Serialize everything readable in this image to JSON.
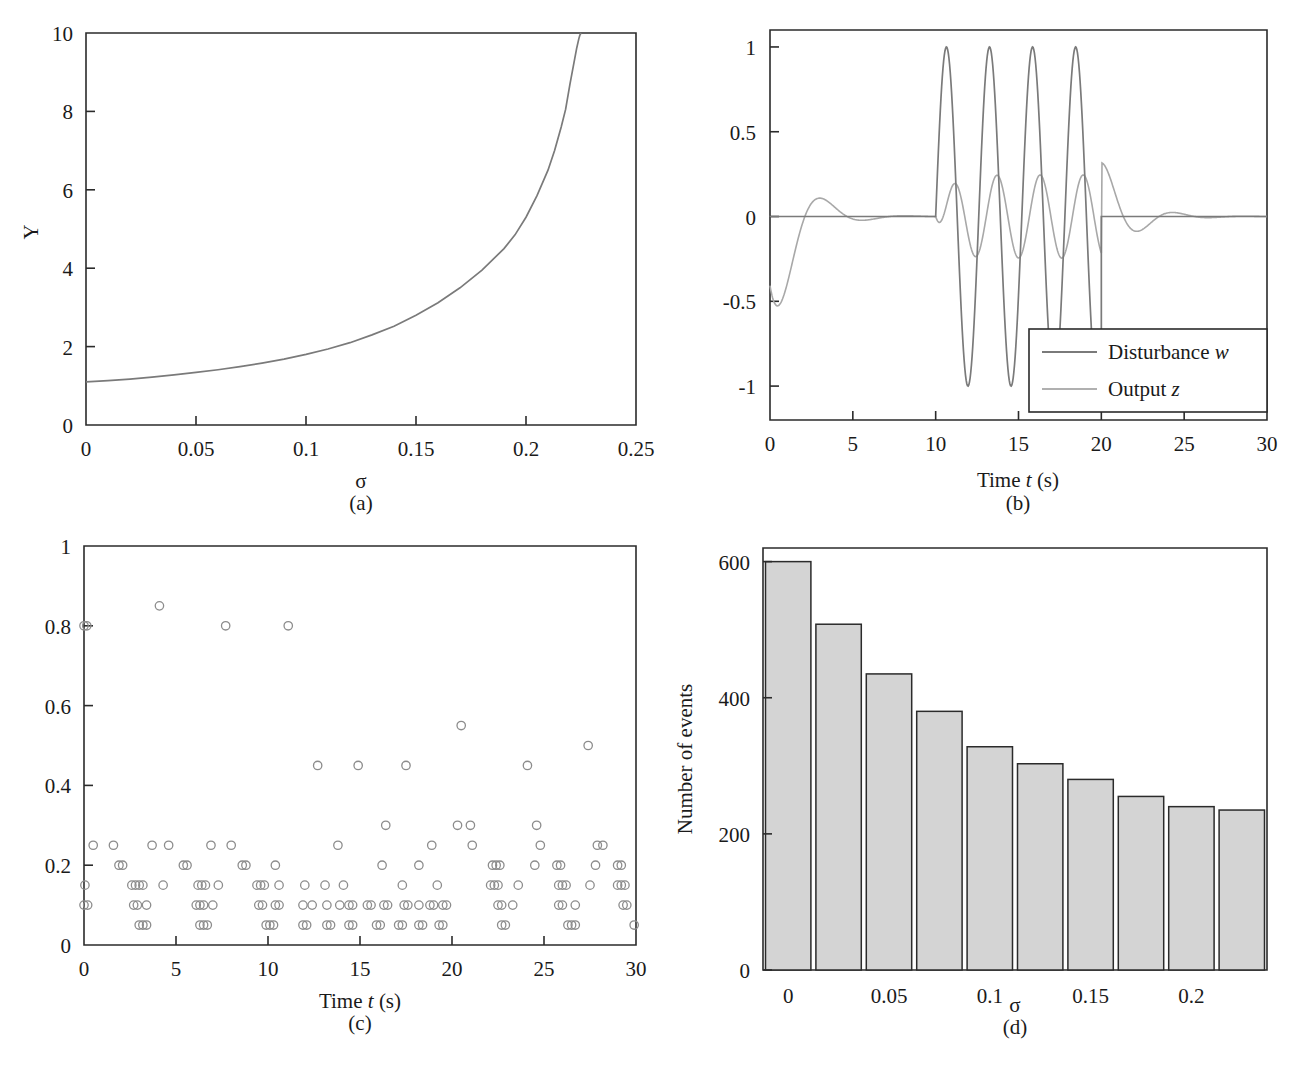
{
  "figure": {
    "running_head_fragment": "",
    "panels": [
      {
        "id": "a",
        "caption": "(a)",
        "chart_data": {
          "type": "line",
          "title": "",
          "xlabel": "σ",
          "ylabel": "Y",
          "xlim": [
            0,
            0.25
          ],
          "ylim": [
            0,
            10
          ],
          "xticks": [
            0,
            0.05,
            0.1,
            0.15,
            0.2,
            0.25
          ],
          "xticklabels": [
            "0",
            "0.05",
            "0.1",
            "0.15",
            "0.2",
            "0.25"
          ],
          "yticks": [
            0,
            2,
            4,
            6,
            8,
            10
          ],
          "yticklabels": [
            "0",
            "2",
            "4",
            "6",
            "8",
            "10"
          ],
          "grid": false,
          "legend": "none",
          "series": [
            {
              "name": "Y(σ)",
              "color": "#7a7a7a",
              "x": [
                0,
                0.01,
                0.02,
                0.03,
                0.04,
                0.05,
                0.06,
                0.07,
                0.08,
                0.09,
                0.1,
                0.11,
                0.12,
                0.13,
                0.14,
                0.15,
                0.16,
                0.17,
                0.18,
                0.19,
                0.195,
                0.2,
                0.205,
                0.21,
                0.213,
                0.216,
                0.218,
                0.22,
                0.221,
                0.222,
                0.223,
                0.224,
                0.2245,
                0.225
              ],
              "y": [
                1.1,
                1.13,
                1.17,
                1.22,
                1.28,
                1.34,
                1.41,
                1.49,
                1.58,
                1.68,
                1.8,
                1.94,
                2.1,
                2.3,
                2.52,
                2.8,
                3.12,
                3.5,
                3.95,
                4.5,
                4.85,
                5.3,
                5.85,
                6.5,
                7.0,
                7.6,
                8.05,
                8.7,
                9.0,
                9.3,
                9.6,
                9.85,
                9.95,
                10.0
              ]
            }
          ]
        }
      },
      {
        "id": "b",
        "caption": "(b)",
        "chart_data": {
          "type": "line",
          "title": "",
          "xlabel": "Time t (s)",
          "xlabel_parts": {
            "pre": "Time ",
            "ital": "t",
            "post": " (s)"
          },
          "ylabel": "",
          "xlim": [
            0,
            30
          ],
          "ylim": [
            -1.2,
            1.1
          ],
          "xticks": [
            0,
            5,
            10,
            15,
            20,
            25,
            30
          ],
          "xticklabels": [
            "0",
            "5",
            "10",
            "15",
            "20",
            "25",
            "30"
          ],
          "yticks": [
            -1,
            -0.5,
            0,
            0.5,
            1
          ],
          "yticklabels": [
            "-1",
            "-0.5",
            "0",
            "0.5",
            "1"
          ],
          "grid": false,
          "legend": "inside-bottom-right",
          "legend_entries": [
            {
              "label": "Disturbance w",
              "label_pre": "Disturbance ",
              "label_ital": "w",
              "color": "#7a7a7a"
            },
            {
              "label": "Output z",
              "label_pre": "Output ",
              "label_ital": "z",
              "color": "#b0b0b0"
            }
          ],
          "series": [
            {
              "name": "Disturbance w",
              "color": "#7a7a7a",
              "description": "Zero for t<10; sinusoid amplitude 1, period ~2.6 s, for 10<=t<=20; zero for t>20",
              "burst_start": 10,
              "burst_end": 20,
              "amplitude": 1,
              "period": 2.6
            },
            {
              "name": "Output z",
              "color": "#b0b0b0",
              "description": "Initial transient dipping to -0.62 near t=1, recovers by t=4 with small bump +0.05 at t=4.6; during burst oscillates between -0.22 and +0.25; after t=20 overshoot +0.3 at t=20.8 decaying to 0 by t=24",
              "initial_min": -0.62,
              "initial_min_time": 1.1,
              "bump_peak": 0.05,
              "bump_time": 4.6,
              "burst_max": 0.25,
              "burst_min": -0.22,
              "post_overshoot": 0.3,
              "post_overshoot_time": 20.8
            }
          ]
        }
      },
      {
        "id": "c",
        "caption": "(c)",
        "chart_data": {
          "type": "scatter",
          "title": "",
          "xlabel": "Time t (s)",
          "xlabel_parts": {
            "pre": "Time ",
            "ital": "t",
            "post": " (s)"
          },
          "ylabel": "",
          "xlim": [
            0,
            30
          ],
          "ylim": [
            0,
            1
          ],
          "xticks": [
            0,
            5,
            10,
            15,
            20,
            25,
            30
          ],
          "xticklabels": [
            "0",
            "5",
            "10",
            "15",
            "20",
            "25",
            "30"
          ],
          "yticks": [
            0,
            0.2,
            0.4,
            0.6,
            0.8,
            1
          ],
          "yticklabels": [
            "0",
            "0.2",
            "0.4",
            "0.6",
            "0.8",
            "1"
          ],
          "grid": false,
          "legend": "none",
          "marker": "open-circle",
          "marker_color": "#8c8c8c",
          "points": [
            [
              0.0,
              0.8
            ],
            [
              0.15,
              0.8
            ],
            [
              4.1,
              0.85
            ],
            [
              7.7,
              0.8
            ],
            [
              11.1,
              0.8
            ],
            [
              20.5,
              0.55
            ],
            [
              27.4,
              0.5
            ],
            [
              12.7,
              0.45
            ],
            [
              14.9,
              0.45
            ],
            [
              17.5,
              0.45
            ],
            [
              24.1,
              0.45
            ],
            [
              16.4,
              0.3
            ],
            [
              20.3,
              0.3
            ],
            [
              21.0,
              0.3
            ],
            [
              24.6,
              0.3
            ],
            [
              0.5,
              0.25
            ],
            [
              1.6,
              0.25
            ],
            [
              3.7,
              0.25
            ],
            [
              4.6,
              0.25
            ],
            [
              6.9,
              0.25
            ],
            [
              8.0,
              0.25
            ],
            [
              13.8,
              0.25
            ],
            [
              18.9,
              0.25
            ],
            [
              21.1,
              0.25
            ],
            [
              24.8,
              0.25
            ],
            [
              27.9,
              0.25
            ],
            [
              28.2,
              0.25
            ],
            [
              1.9,
              0.2
            ],
            [
              2.1,
              0.2
            ],
            [
              5.4,
              0.2
            ],
            [
              5.6,
              0.2
            ],
            [
              8.6,
              0.2
            ],
            [
              8.8,
              0.2
            ],
            [
              10.4,
              0.2
            ],
            [
              16.2,
              0.2
            ],
            [
              18.2,
              0.2
            ],
            [
              22.2,
              0.2
            ],
            [
              22.4,
              0.2
            ],
            [
              22.6,
              0.2
            ],
            [
              24.5,
              0.2
            ],
            [
              25.7,
              0.2
            ],
            [
              25.9,
              0.2
            ],
            [
              27.8,
              0.2
            ],
            [
              29.0,
              0.2
            ],
            [
              29.2,
              0.2
            ],
            [
              0.05,
              0.15
            ],
            [
              2.6,
              0.15
            ],
            [
              2.8,
              0.15
            ],
            [
              3.0,
              0.15
            ],
            [
              3.2,
              0.15
            ],
            [
              4.3,
              0.15
            ],
            [
              6.2,
              0.15
            ],
            [
              6.4,
              0.15
            ],
            [
              6.6,
              0.15
            ],
            [
              7.3,
              0.15
            ],
            [
              9.4,
              0.15
            ],
            [
              9.6,
              0.15
            ],
            [
              9.8,
              0.15
            ],
            [
              10.6,
              0.15
            ],
            [
              12.0,
              0.15
            ],
            [
              13.1,
              0.15
            ],
            [
              14.1,
              0.15
            ],
            [
              17.3,
              0.15
            ],
            [
              19.2,
              0.15
            ],
            [
              22.1,
              0.15
            ],
            [
              22.3,
              0.15
            ],
            [
              22.5,
              0.15
            ],
            [
              23.6,
              0.15
            ],
            [
              25.8,
              0.15
            ],
            [
              26.0,
              0.15
            ],
            [
              26.2,
              0.15
            ],
            [
              27.5,
              0.15
            ],
            [
              29.0,
              0.15
            ],
            [
              29.2,
              0.15
            ],
            [
              29.4,
              0.15
            ],
            [
              0.0,
              0.1
            ],
            [
              0.2,
              0.1
            ],
            [
              2.7,
              0.1
            ],
            [
              2.9,
              0.1
            ],
            [
              3.4,
              0.1
            ],
            [
              6.1,
              0.1
            ],
            [
              6.3,
              0.1
            ],
            [
              6.5,
              0.1
            ],
            [
              7.0,
              0.1
            ],
            [
              9.5,
              0.1
            ],
            [
              9.7,
              0.1
            ],
            [
              10.4,
              0.1
            ],
            [
              10.6,
              0.1
            ],
            [
              11.9,
              0.1
            ],
            [
              12.4,
              0.1
            ],
            [
              13.2,
              0.1
            ],
            [
              13.9,
              0.1
            ],
            [
              14.4,
              0.1
            ],
            [
              14.6,
              0.1
            ],
            [
              15.4,
              0.1
            ],
            [
              15.6,
              0.1
            ],
            [
              16.3,
              0.1
            ],
            [
              16.5,
              0.1
            ],
            [
              17.4,
              0.1
            ],
            [
              17.6,
              0.1
            ],
            [
              18.2,
              0.1
            ],
            [
              18.8,
              0.1
            ],
            [
              19.0,
              0.1
            ],
            [
              19.5,
              0.1
            ],
            [
              19.7,
              0.1
            ],
            [
              22.5,
              0.1
            ],
            [
              22.7,
              0.1
            ],
            [
              23.3,
              0.1
            ],
            [
              25.8,
              0.1
            ],
            [
              26.0,
              0.1
            ],
            [
              26.7,
              0.1
            ],
            [
              29.3,
              0.1
            ],
            [
              29.5,
              0.1
            ],
            [
              3.0,
              0.05
            ],
            [
              3.2,
              0.05
            ],
            [
              3.4,
              0.05
            ],
            [
              6.3,
              0.05
            ],
            [
              6.5,
              0.05
            ],
            [
              6.7,
              0.05
            ],
            [
              9.9,
              0.05
            ],
            [
              10.1,
              0.05
            ],
            [
              10.3,
              0.05
            ],
            [
              11.9,
              0.05
            ],
            [
              12.1,
              0.05
            ],
            [
              13.2,
              0.05
            ],
            [
              13.4,
              0.05
            ],
            [
              14.4,
              0.05
            ],
            [
              14.6,
              0.05
            ],
            [
              15.9,
              0.05
            ],
            [
              16.1,
              0.05
            ],
            [
              17.1,
              0.05
            ],
            [
              17.3,
              0.05
            ],
            [
              18.2,
              0.05
            ],
            [
              18.4,
              0.05
            ],
            [
              19.3,
              0.05
            ],
            [
              19.5,
              0.05
            ],
            [
              22.7,
              0.05
            ],
            [
              22.9,
              0.05
            ],
            [
              26.3,
              0.05
            ],
            [
              26.5,
              0.05
            ],
            [
              26.7,
              0.05
            ],
            [
              29.9,
              0.05
            ]
          ]
        }
      },
      {
        "id": "d",
        "caption": "(d)",
        "chart_data": {
          "type": "bar",
          "title": "",
          "xlabel": "σ",
          "ylabel": "Number of events",
          "xlim": [
            -0.0125,
            0.2375
          ],
          "ylim": [
            0,
            620
          ],
          "xticks": [
            0,
            0.05,
            0.1,
            0.15,
            0.2
          ],
          "xticklabels": [
            "0",
            "0.05",
            "0.1",
            "0.15",
            "0.2"
          ],
          "yticks": [
            0,
            200,
            400,
            600
          ],
          "yticklabels": [
            "0",
            "200",
            "400",
            "600"
          ],
          "grid": false,
          "legend": "none",
          "bar_color": "#d4d4d4",
          "bar_edge": "#2b2b2b",
          "categories": [
            "0",
            "0.025",
            "0.05",
            "0.075",
            "0.1",
            "0.125",
            "0.15",
            "0.175",
            "0.2",
            "0.225"
          ],
          "bin_centers": [
            0,
            0.025,
            0.05,
            0.075,
            0.1,
            0.125,
            0.15,
            0.175,
            0.2,
            0.225
          ],
          "values": [
            600,
            508,
            435,
            380,
            328,
            303,
            280,
            255,
            240,
            235
          ]
        }
      }
    ]
  }
}
